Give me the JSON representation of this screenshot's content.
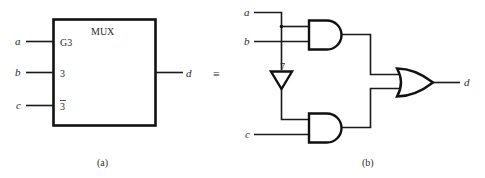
{
  "figure_a": {
    "block_title": "MUX",
    "inputs": [
      {
        "name": "a",
        "pin_label": "G3"
      },
      {
        "name": "b",
        "pin_label": "3"
      },
      {
        "name": "c",
        "pin_label": "3",
        "pin_overbar": true
      }
    ],
    "output": {
      "name": "d"
    },
    "caption": "(a)"
  },
  "equivalence_symbol": "≡",
  "figure_b": {
    "inputs": [
      "a",
      "b",
      "c"
    ],
    "gates": [
      {
        "type": "AND",
        "inputs": [
          "a",
          "b"
        ]
      },
      {
        "type": "NOT",
        "input": "a",
        "marker": "7"
      },
      {
        "type": "AND",
        "inputs": [
          "not a",
          "c"
        ]
      },
      {
        "type": "OR",
        "inputs": [
          "AND1",
          "AND2"
        ]
      }
    ],
    "output": "d",
    "caption": "(b)"
  }
}
